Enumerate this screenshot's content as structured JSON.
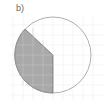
{
  "figure": {
    "label": "b)",
    "circle": {
      "cx": 53,
      "cy": 55,
      "r": 38,
      "stroke": "#9a9a9a"
    },
    "shaded_sector": {
      "fill": "#a9a9a9",
      "points": {
        "arc_start": [
          25,
          29
        ],
        "center": [
          53,
          55
        ],
        "arc_end": [
          53,
          93
        ]
      }
    },
    "grid": {
      "spacing": 10,
      "color": "#eeeeee"
    }
  }
}
